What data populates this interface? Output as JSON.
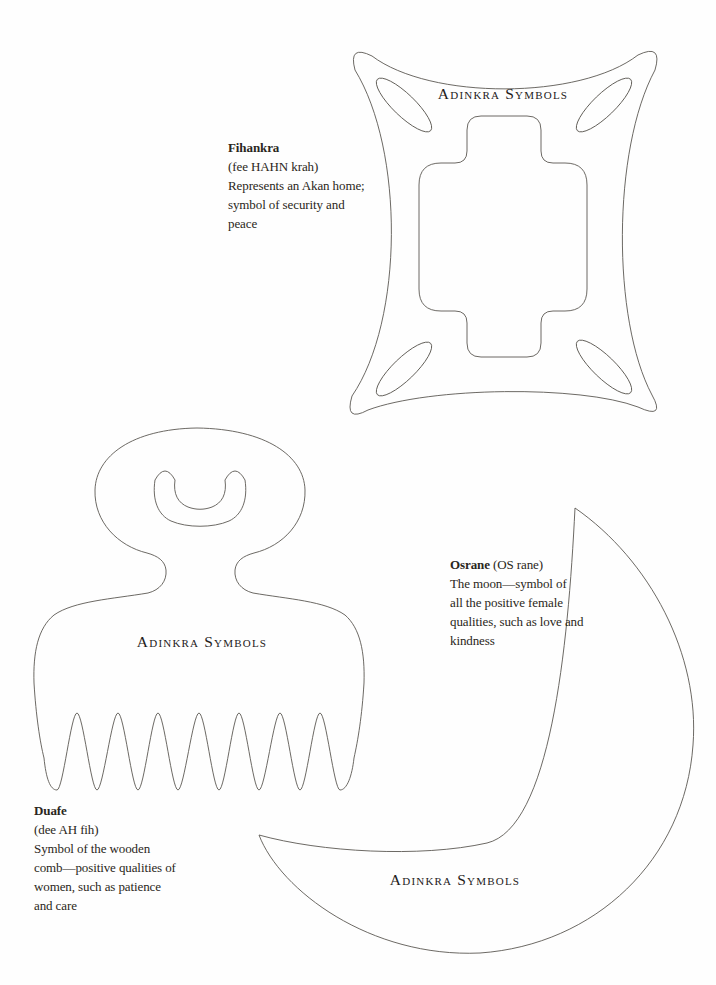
{
  "page": {
    "background_color": "#fefefe",
    "ink_color": "#5b5852",
    "text_color": "#2a2620"
  },
  "symbols": [
    {
      "id": "fihankra",
      "label": "Adinkra Symbols",
      "name": "Fihankra",
      "pronunciation": "(fee HAHN krah)",
      "description_lines": [
        "Represents an Akan home;",
        "symbol of security and",
        "peace"
      ]
    },
    {
      "id": "duafe",
      "label": "Adinkra Symbols",
      "name": "Duafe",
      "pronunciation": "(dee AH fih)",
      "description_lines": [
        "Symbol of the wooden",
        "comb—positive qualities of",
        "women, such as patience",
        "and care"
      ]
    },
    {
      "id": "osrane",
      "label": "Adinkra Symbols",
      "name": "Osrane",
      "pronunciation": "(OS rane)",
      "description_lines": [
        "The moon—symbol of",
        "all the positive female",
        "qualities, such as love and",
        "kindness"
      ]
    }
  ]
}
